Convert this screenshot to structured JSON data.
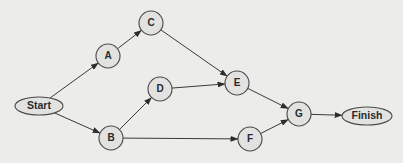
{
  "diagram": {
    "type": "network-activity-diagram",
    "nodes": [
      {
        "id": "Start",
        "label": "Start",
        "shape": "ellipse",
        "x": 39,
        "y": 106,
        "rx": 24,
        "ry": 9
      },
      {
        "id": "A",
        "label": "A",
        "shape": "circle",
        "x": 108,
        "y": 56,
        "r": 12
      },
      {
        "id": "B",
        "label": "B",
        "shape": "circle",
        "x": 111,
        "y": 138,
        "r": 12
      },
      {
        "id": "C",
        "label": "C",
        "shape": "circle",
        "x": 151,
        "y": 23,
        "r": 12
      },
      {
        "id": "D",
        "label": "D",
        "shape": "circle",
        "x": 160,
        "y": 89,
        "r": 12
      },
      {
        "id": "E",
        "label": "E",
        "shape": "circle",
        "x": 237,
        "y": 83,
        "r": 12
      },
      {
        "id": "F",
        "label": "F",
        "shape": "circle",
        "x": 250,
        "y": 139,
        "r": 12
      },
      {
        "id": "G",
        "label": "G",
        "shape": "circle",
        "x": 299,
        "y": 114,
        "r": 12
      },
      {
        "id": "Finish",
        "label": "Finish",
        "shape": "ellipse",
        "x": 367,
        "y": 116,
        "rx": 25,
        "ry": 9
      }
    ],
    "edges": [
      {
        "from": "Start",
        "to": "A"
      },
      {
        "from": "Start",
        "to": "B"
      },
      {
        "from": "A",
        "to": "C"
      },
      {
        "from": "C",
        "to": "E"
      },
      {
        "from": "B",
        "to": "D"
      },
      {
        "from": "B",
        "to": "F"
      },
      {
        "from": "D",
        "to": "E"
      },
      {
        "from": "E",
        "to": "G"
      },
      {
        "from": "F",
        "to": "G"
      },
      {
        "from": "G",
        "to": "Finish"
      }
    ]
  },
  "colors": {
    "background": "#ececea",
    "node_fill": "#e2e2e0",
    "stroke": "#3a3a3a",
    "text": "#2a2a2a"
  }
}
